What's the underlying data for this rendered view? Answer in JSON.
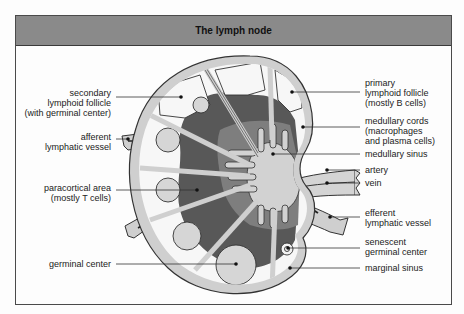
{
  "title": "The lymph node",
  "labels_left": [
    {
      "id": "secondary-lymphoid-follicle",
      "lines": [
        "secondary",
        "lymphoid follicle",
        "(with germinal center)"
      ]
    },
    {
      "id": "afferent-lymphatic-vessel",
      "lines": [
        "afferent",
        "lymphatic vessel"
      ]
    },
    {
      "id": "paracortical-area",
      "lines": [
        "paracortical area",
        "(mostly T cells)"
      ]
    },
    {
      "id": "germinal-center",
      "lines": [
        "germinal center"
      ]
    }
  ],
  "labels_right": [
    {
      "id": "primary-lymphoid-follicle",
      "lines": [
        "primary",
        "lymphoid follicle",
        "(mostly B cells)"
      ]
    },
    {
      "id": "medullary-cords",
      "lines": [
        "medullary cords",
        "(macrophages",
        "and plasma cells)"
      ]
    },
    {
      "id": "medullary-sinus",
      "lines": [
        "medullary sinus"
      ]
    },
    {
      "id": "artery",
      "lines": [
        "artery"
      ]
    },
    {
      "id": "vein",
      "lines": [
        "vein"
      ]
    },
    {
      "id": "efferent-lymphatic-vessel",
      "lines": [
        "efferent",
        "lymphatic vessel"
      ]
    },
    {
      "id": "senescent-germinal-center",
      "lines": [
        "senescent",
        "germinal center"
      ]
    },
    {
      "id": "marginal-sinus",
      "lines": [
        "marginal sinus"
      ]
    }
  ],
  "text": {
    "l0": "secondary\nlymphoid follicle\n(with germinal center)",
    "l1": "afferent\nlymphatic vessel",
    "l2": "paracortical area\n(mostly T cells)",
    "l3": "germinal center",
    "r0": "primary\nlymphoid follicle\n(mostly B cells)",
    "r1": "medullary cords\n(macrophages\nand plasma cells)",
    "r2": "medullary sinus",
    "r3": "artery",
    "r4": "vein",
    "r5": "efferent\nlymphatic vessel",
    "r6": "senescent\ngerminal center",
    "r7": "marginal sinus"
  },
  "colors": {
    "header_bg": "#8a8a8a",
    "capsule": "#cfcfcf",
    "paracortex": "#5a5a5a",
    "medullary_cords": "#7e7e7e",
    "medulla_sinus": "#d2d2d2",
    "follicle_light": "#d6d6d6",
    "cortex_white": "#f7f7f7"
  }
}
